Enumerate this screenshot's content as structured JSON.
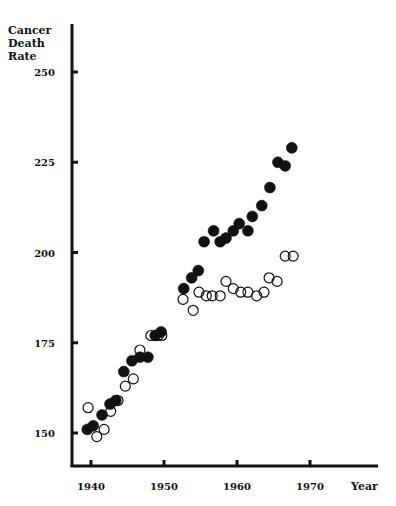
{
  "chart_data": {
    "type": "scatter",
    "title": "",
    "ylabel_lines": [
      "Cancer",
      "Death",
      "Rate"
    ],
    "xlabel": "Year",
    "xlim": [
      1936.5,
      1978
    ],
    "ylim": [
      140,
      260
    ],
    "xticks": [
      1940,
      1950,
      1960,
      1970
    ],
    "xtick_labels": [
      "1940",
      "1950",
      "1960",
      "1970"
    ],
    "yticks": [
      150,
      175,
      200,
      225,
      250
    ],
    "ytick_labels": [
      "150",
      "175",
      "200",
      "225",
      "250"
    ],
    "grid": false,
    "legend": null,
    "series": [
      {
        "name": "filled",
        "marker": "filled-circle",
        "color": "#111111",
        "points": [
          [
            1939.5,
            151
          ],
          [
            1940.3,
            152
          ],
          [
            1941.5,
            155
          ],
          [
            1942.6,
            158
          ],
          [
            1943.4,
            159
          ],
          [
            1944.5,
            167
          ],
          [
            1945.6,
            170
          ],
          [
            1946.7,
            171
          ],
          [
            1947.8,
            171
          ],
          [
            1948.8,
            177
          ],
          [
            1949.6,
            178
          ],
          [
            1952.7,
            190
          ],
          [
            1953.8,
            193
          ],
          [
            1954.7,
            195
          ],
          [
            1955.5,
            203
          ],
          [
            1956.8,
            206
          ],
          [
            1957.7,
            203
          ],
          [
            1958.5,
            204
          ],
          [
            1959.5,
            206
          ],
          [
            1960.3,
            208
          ],
          [
            1961.5,
            206
          ],
          [
            1962.1,
            210
          ],
          [
            1963.4,
            213
          ],
          [
            1964.5,
            218
          ],
          [
            1965.6,
            225
          ],
          [
            1966.6,
            224
          ],
          [
            1967.5,
            229
          ]
        ]
      },
      {
        "name": "open",
        "marker": "open-circle",
        "color": "#111111",
        "points": [
          [
            1939.6,
            157
          ],
          [
            1940.8,
            149
          ],
          [
            1941.8,
            151
          ],
          [
            1942.7,
            156
          ],
          [
            1943.7,
            159
          ],
          [
            1944.7,
            163
          ],
          [
            1945.8,
            165
          ],
          [
            1946.7,
            173
          ],
          [
            1948.2,
            177
          ],
          [
            1949.2,
            177
          ],
          [
            1949.7,
            177
          ],
          [
            1952.6,
            187
          ],
          [
            1954.0,
            184
          ],
          [
            1954.8,
            189
          ],
          [
            1955.8,
            188
          ],
          [
            1956.6,
            188
          ],
          [
            1957.7,
            188
          ],
          [
            1958.5,
            192
          ],
          [
            1959.5,
            190
          ],
          [
            1960.5,
            189
          ],
          [
            1961.5,
            189
          ],
          [
            1962.7,
            188
          ],
          [
            1963.7,
            189
          ],
          [
            1964.4,
            193
          ],
          [
            1965.5,
            192
          ],
          [
            1966.6,
            199
          ],
          [
            1967.7,
            199
          ]
        ]
      }
    ]
  }
}
